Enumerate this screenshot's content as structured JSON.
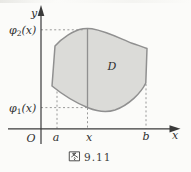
{
  "figure": {
    "caption": "图 9.11",
    "caption_number": "9.11",
    "region_label": "D",
    "axis": {
      "y_label": "y",
      "x_label": "x",
      "origin_label": "O"
    },
    "x_ticks": {
      "a": "a",
      "x": "x",
      "b": "b"
    },
    "curve_labels": {
      "upper": {
        "func": "φ",
        "sub": "2",
        "arg": "(x)"
      },
      "lower": {
        "func": "φ",
        "sub": "1",
        "arg": "(x)"
      }
    },
    "colors": {
      "background": "#fbfbf9",
      "region_fill": "#dbdbd8",
      "region_stroke": "#909090",
      "axis_color": "#3a3a3a",
      "dash_color": "#8d8d8d",
      "text_color": "#2f2f2f",
      "caption_color": "#3c3c3c"
    }
  }
}
